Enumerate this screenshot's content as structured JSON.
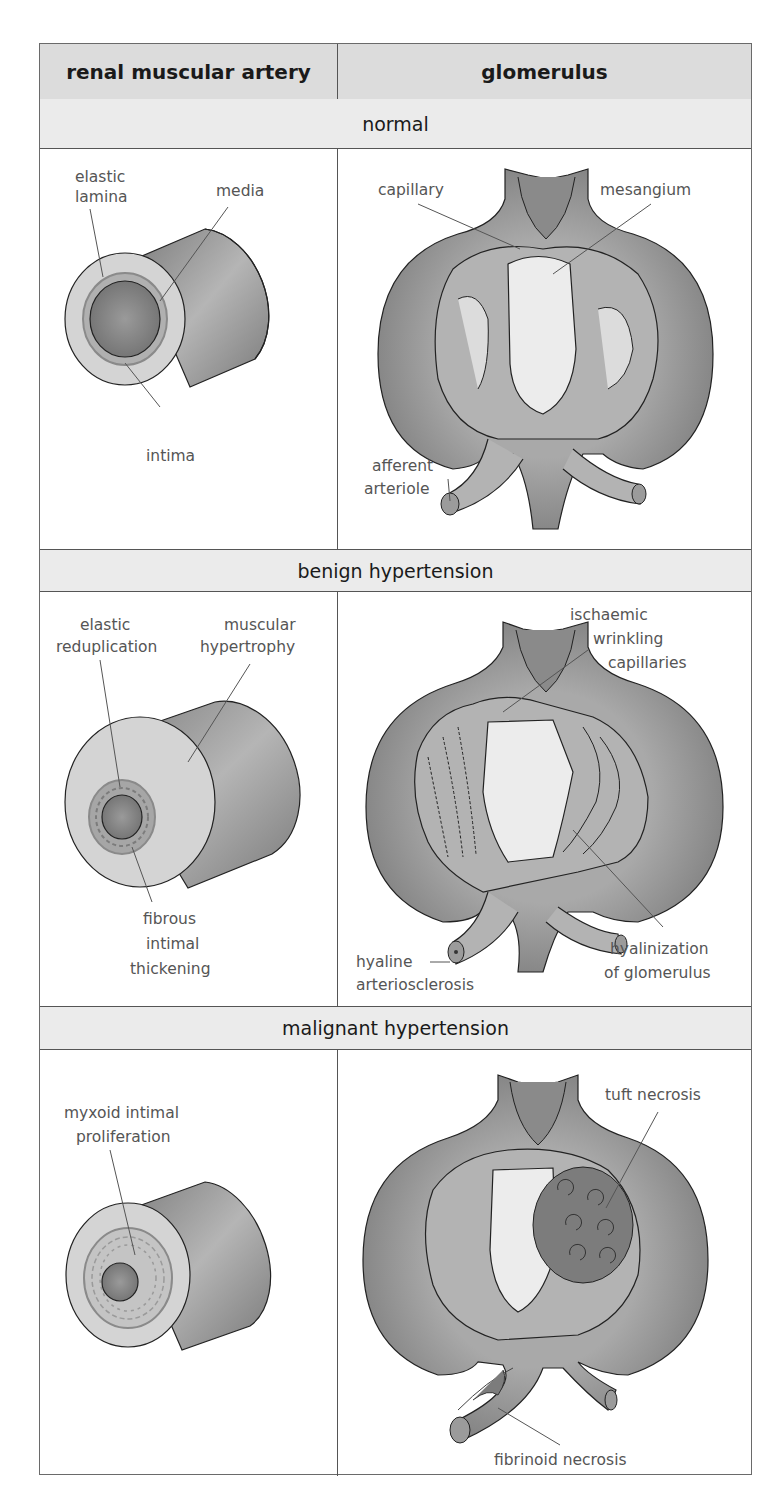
{
  "header": {
    "col1": "renal muscular artery",
    "col2": "glomerulus"
  },
  "sections": [
    {
      "title": "normal",
      "artery": {
        "labels": [
          "elastic",
          "lamina",
          "media",
          "intima"
        ]
      },
      "glomerulus": {
        "labels": [
          "capillary",
          "mesangium",
          "afferent",
          "arteriole"
        ]
      }
    },
    {
      "title": "benign hypertension",
      "artery": {
        "labels": [
          "elastic",
          "reduplication",
          "muscular",
          "hypertrophy",
          "fibrous",
          "intimal",
          "thickening"
        ]
      },
      "glomerulus": {
        "labels": [
          "ischaemic",
          "wrinkling",
          "capillaries",
          "hyaline",
          "arteriosclerosis",
          "hyalinization",
          "of glomerulus"
        ]
      }
    },
    {
      "title": "malignant hypertension",
      "artery": {
        "labels": [
          "myxoid intimal",
          "proliferation"
        ]
      },
      "glomerulus": {
        "labels": [
          "tuft necrosis",
          "fibrinoid necrosis"
        ]
      }
    }
  ],
  "colors": {
    "header_bg": "#dcdcdc",
    "band_bg": "#ebebeb",
    "vessel_dark": "#8a8a8a",
    "vessel_mid": "#a8a8a8",
    "vessel_light": "#cfcfcf",
    "lumen_light": "#ededed",
    "necrosis": "#7c7c7c",
    "text": "#1a1a1a",
    "label": "#555555"
  }
}
